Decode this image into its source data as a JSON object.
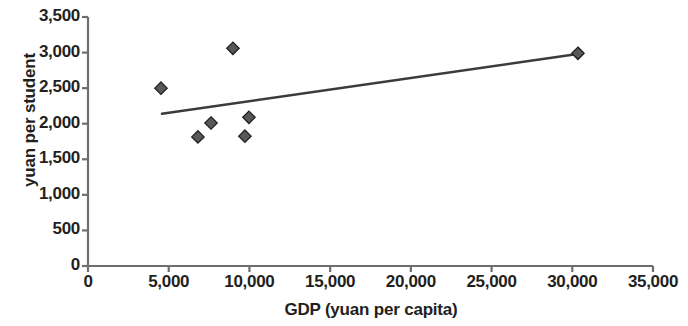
{
  "chart_data": {
    "type": "scatter",
    "title": "",
    "xlabel": "GDP (yuan per capita)",
    "ylabel": "yuan per student",
    "xlim": [
      0,
      35000
    ],
    "ylim": [
      0,
      3500
    ],
    "xticks": [
      0,
      5000,
      10000,
      15000,
      20000,
      25000,
      30000,
      35000
    ],
    "xtick_labels": [
      "0",
      "5,000",
      "10,000",
      "15,000",
      "20,000",
      "25,000",
      "30,000",
      "35,000"
    ],
    "yticks": [
      0,
      500,
      1000,
      1500,
      2000,
      2500,
      3000,
      3500
    ],
    "ytick_labels": [
      "0",
      "500",
      "1,000",
      "1,500",
      "2,000",
      "2,500",
      "3,000",
      "3,500"
    ],
    "grid": false,
    "legend": "none",
    "marker": "diamond",
    "marker_color": "#58585a",
    "marker_edge_color": "#231f20",
    "series": [
      {
        "name": "provinces",
        "points": [
          {
            "x": 4520,
            "y": 2500
          },
          {
            "x": 6810,
            "y": 1815
          },
          {
            "x": 7620,
            "y": 2010
          },
          {
            "x": 8980,
            "y": 3060
          },
          {
            "x": 9720,
            "y": 1825
          },
          {
            "x": 9970,
            "y": 2090
          },
          {
            "x": 30350,
            "y": 2990
          }
        ]
      }
    ],
    "trendline": {
      "type": "linear",
      "color": "#3b3b3d",
      "x_start": 4580,
      "y_start": 2140,
      "x_end": 30650,
      "y_end": 2990
    },
    "axis_color": "#6d6e70"
  }
}
